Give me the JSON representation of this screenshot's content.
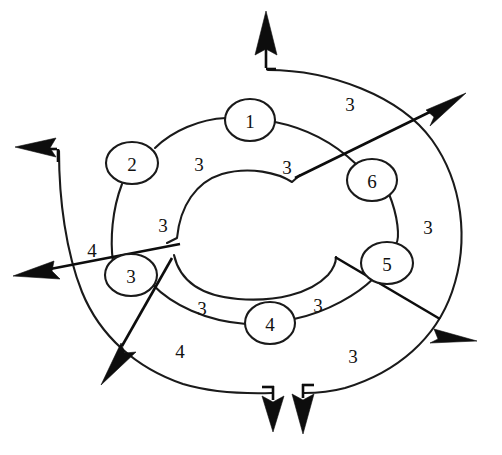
{
  "diagram": {
    "background_color": "#ffffff",
    "stroke_color": "#1a1a1a",
    "nodes": [
      {
        "id": "node-1",
        "label": "1",
        "cx": 250,
        "cy": 120,
        "rx": 25,
        "ry": 21
      },
      {
        "id": "node-2",
        "label": "2",
        "cx": 132,
        "cy": 163,
        "rx": 26,
        "ry": 21
      },
      {
        "id": "node-3",
        "label": "3",
        "cx": 131,
        "cy": 275,
        "rx": 26,
        "ry": 21
      },
      {
        "id": "node-4",
        "label": "4",
        "cx": 270,
        "cy": 323,
        "rx": 25,
        "ry": 21
      },
      {
        "id": "node-5",
        "label": "5",
        "cx": 387,
        "cy": 263,
        "rx": 26,
        "ry": 21
      },
      {
        "id": "node-6",
        "label": "6",
        "cx": 372,
        "cy": 180,
        "rx": 25,
        "ry": 21
      }
    ],
    "edge_labels": [
      {
        "id": "label-outer-top-right",
        "text": "3",
        "x": 350,
        "y": 104
      },
      {
        "id": "label-inner-top-left",
        "text": "3",
        "x": 199,
        "y": 164
      },
      {
        "id": "label-inner-top-right",
        "text": "3",
        "x": 287,
        "y": 167
      },
      {
        "id": "label-inner-left",
        "text": "3",
        "x": 163,
        "y": 225
      },
      {
        "id": "label-outer-right",
        "text": "3",
        "x": 428,
        "y": 227
      },
      {
        "id": "label-outer-left-4",
        "text": "4",
        "x": 92,
        "y": 250
      },
      {
        "id": "label-mid-bottom-left",
        "text": "3",
        "x": 202,
        "y": 308
      },
      {
        "id": "label-mid-bottom-right",
        "text": "3",
        "x": 318,
        "y": 305
      },
      {
        "id": "label-outer-bottom-left-4",
        "text": "4",
        "x": 180,
        "y": 351
      },
      {
        "id": "label-outer-bottom-right",
        "text": "3",
        "x": 353,
        "y": 356
      }
    ],
    "arrows": [
      {
        "id": "arrow-top-up",
        "direction": "up"
      },
      {
        "id": "arrow-upper-right",
        "direction": "up-right"
      },
      {
        "id": "arrow-upper-left",
        "direction": "left"
      },
      {
        "id": "arrow-mid-left",
        "direction": "left"
      },
      {
        "id": "arrow-lower-right",
        "direction": "down-right"
      },
      {
        "id": "arrow-bottom-left",
        "direction": "down-left"
      },
      {
        "id": "arrow-bottom-inner",
        "direction": "down"
      },
      {
        "id": "arrow-bottom-outer",
        "direction": "down"
      }
    ]
  }
}
